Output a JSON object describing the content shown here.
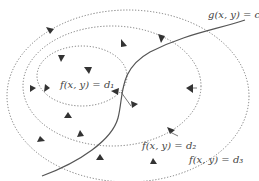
{
  "diagram": {
    "constraint_label": "g(x, y) = c",
    "contours": [
      {
        "id": "d1",
        "label": "f(x, y) = d₁"
      },
      {
        "id": "d2",
        "label": "f(x, y) = d₂"
      },
      {
        "id": "d3",
        "label": "f(x, y) = d₃"
      }
    ],
    "colors": {
      "contour": "#666666",
      "constraint": "#555555",
      "arrow": "#444444",
      "text": "#444444"
    }
  }
}
